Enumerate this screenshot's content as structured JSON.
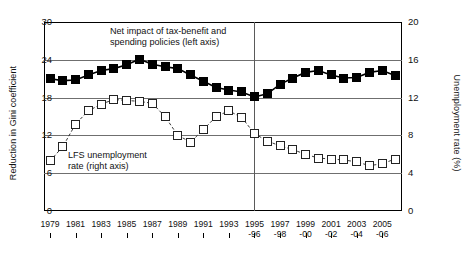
{
  "axes": {
    "left_title": "Reduction in Gini coefficient",
    "right_title": "Unemployment rate (%)",
    "left_ticks": [
      "30",
      "24",
      "18",
      "12",
      "6",
      "0"
    ],
    "right_ticks": [
      "20",
      "16",
      "12",
      "8",
      "4",
      "0"
    ]
  },
  "annotations": {
    "series1_line1": "Net impact of tax-benefit and",
    "series1_line2": "spending policies (left axis)",
    "series2_line1": "LFS unemployment",
    "series2_line2": "rate (right axis)"
  },
  "chart_data": {
    "type": "line",
    "title": "",
    "xlabel": "",
    "ylabel": "Reduction in Gini coefficient",
    "ylabel_secondary": "Unemployment rate (%)",
    "ylim": [
      0,
      30
    ],
    "ylim_secondary": [
      0,
      20
    ],
    "grid": true,
    "legend": "inline-annotation",
    "vertical_divider_at": "1995-96",
    "categories": [
      "1979",
      "1980",
      "1981",
      "1982",
      "1983",
      "1984",
      "1985",
      "1986",
      "1987",
      "1988",
      "1989",
      "1990",
      "1991",
      "1992",
      "1993",
      "1994",
      "1995-96",
      "1996-97",
      "1997-98",
      "1998-99",
      "1999-00",
      "2000-01",
      "2001-02",
      "2002-03",
      "2003-04",
      "2004-05",
      "2005-06",
      "2006-07"
    ],
    "tick_labels": [
      {
        "top": "1979",
        "bottom": ""
      },
      {
        "top": "1981",
        "bottom": ""
      },
      {
        "top": "1983",
        "bottom": ""
      },
      {
        "top": "1985",
        "bottom": ""
      },
      {
        "top": "1987",
        "bottom": ""
      },
      {
        "top": "1989",
        "bottom": ""
      },
      {
        "top": "1991",
        "bottom": ""
      },
      {
        "top": "1993",
        "bottom": ""
      },
      {
        "top": "1995",
        "bottom": "-96"
      },
      {
        "top": "1997",
        "bottom": "-98"
      },
      {
        "top": "1999",
        "bottom": "-00"
      },
      {
        "top": "2001",
        "bottom": "-02"
      },
      {
        "top": "2003",
        "bottom": "-04"
      },
      {
        "top": "2005",
        "bottom": "-06"
      }
    ],
    "series": [
      {
        "name": "Net impact of tax-benefit and spending policies (left axis)",
        "axis": "left",
        "marker": "filled-square",
        "color": "#000000",
        "values": [
          21.0,
          20.7,
          20.8,
          21.6,
          22.3,
          22.6,
          23.2,
          24.1,
          23.3,
          22.9,
          22.6,
          21.6,
          20.6,
          19.6,
          19.2,
          18.9,
          18.1,
          18.6,
          20.1,
          21.1,
          22.0,
          22.3,
          21.6,
          21.1,
          21.2,
          22.0,
          22.3,
          21.5
        ]
      },
      {
        "name": "LFS unemployment rate (right axis)",
        "axis": "right",
        "marker": "open-square",
        "color": "#222222",
        "values": [
          5.3,
          6.8,
          9.2,
          10.6,
          11.3,
          11.8,
          11.7,
          11.6,
          11.4,
          10.0,
          8.0,
          7.3,
          8.6,
          10.0,
          10.6,
          9.9,
          8.2,
          7.4,
          6.9,
          6.5,
          6.0,
          5.6,
          5.5,
          5.4,
          5.2,
          4.8,
          5.0,
          5.5
        ]
      }
    ]
  }
}
